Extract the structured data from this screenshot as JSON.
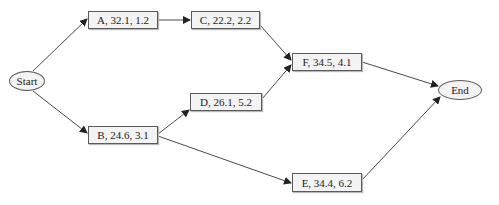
{
  "diagram": {
    "type": "network activity diagram",
    "nodes": {
      "start": {
        "label": "Start",
        "shape": "ellipse"
      },
      "end": {
        "label": "End",
        "shape": "ellipse"
      },
      "A": {
        "label": "A, 32.1, 1.2"
      },
      "B": {
        "label": "B, 24.6, 3.1"
      },
      "C": {
        "label": "C, 22.2, 2.2"
      },
      "D": {
        "label": "D, 26.1, 5.2"
      },
      "E": {
        "label": "E, 34.4, 6.2"
      },
      "F": {
        "label": "F, 34.5, 4.1"
      }
    },
    "edges": [
      {
        "from": "Start",
        "to": "A"
      },
      {
        "from": "Start",
        "to": "B"
      },
      {
        "from": "A",
        "to": "C"
      },
      {
        "from": "B",
        "to": "D"
      },
      {
        "from": "B",
        "to": "E"
      },
      {
        "from": "C",
        "to": "F"
      },
      {
        "from": "D",
        "to": "F"
      },
      {
        "from": "F",
        "to": "End"
      },
      {
        "from": "E",
        "to": "End"
      }
    ],
    "colors": {
      "node_fill": "#f3f3f3",
      "stroke": "#5a5a5a",
      "edge": "#333333"
    }
  }
}
